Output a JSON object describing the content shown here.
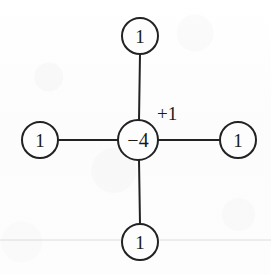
{
  "figure": {
    "background_color": "#fdfdfd",
    "stroke_color": "#222222",
    "text_color": "#1a1a1a",
    "scan_line_color": "#dcdcdc",
    "center_node": {
      "label": "−4",
      "cx": 138,
      "cy": 140,
      "r": 20
    },
    "neighbor_nodes": [
      {
        "name": "north",
        "label": "1",
        "cx": 140,
        "cy": 36,
        "r": 18
      },
      {
        "name": "west",
        "label": "1",
        "cx": 40,
        "cy": 140,
        "r": 18
      },
      {
        "name": "east",
        "label": "1",
        "cx": 238,
        "cy": 140,
        "r": 18
      },
      {
        "name": "south",
        "label": "1",
        "cx": 140,
        "cy": 242,
        "r": 18
      }
    ],
    "edges": [
      {
        "name": "edge-north",
        "x1": 139,
        "y1": 120,
        "x2": 140,
        "y2": 54
      },
      {
        "name": "edge-west",
        "x1": 118,
        "y1": 140,
        "x2": 58,
        "y2": 140
      },
      {
        "name": "edge-east",
        "x1": 158,
        "y1": 140,
        "x2": 220,
        "y2": 140
      },
      {
        "name": "edge-south",
        "x1": 139,
        "y1": 160,
        "x2": 140,
        "y2": 224
      }
    ],
    "annotations": [
      {
        "name": "plus-one-annotation",
        "label": "+1",
        "x": 157,
        "y": 120
      }
    ],
    "scan_line": {
      "y": 240,
      "x1": 0,
      "x2": 271
    }
  }
}
